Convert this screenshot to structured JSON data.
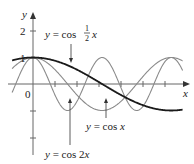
{
  "chart_data": {
    "type": "line",
    "title": "",
    "xlabel": "x",
    "ylabel": "y",
    "origin_label": "0",
    "y_tick_labels": [
      "1",
      "2"
    ],
    "xlim": [
      -0.95,
      6.8
    ],
    "ylim": [
      -2.6,
      2.6
    ],
    "grid": false,
    "legend": "annotations with arrows",
    "series": [
      {
        "name": "y = cos ½x",
        "function": "cos(x/2)",
        "style": "thick dark",
        "color": "#1a1a1a"
      },
      {
        "name": "y = cos x",
        "function": "cos(x)",
        "style": "thin gray",
        "color": "#8a8a8a"
      },
      {
        "name": "y = cos 2x",
        "function": "cos(2x)",
        "style": "thin gray",
        "color": "#8a8a8a"
      }
    ],
    "annotations": [
      {
        "text_prefix": "y = cos",
        "frac_num": "1",
        "frac_den": "2",
        "text_suffix": "x"
      },
      {
        "text": "y = cos x"
      },
      {
        "text": "y = cos 2x"
      }
    ]
  },
  "axes": {
    "x_label": "x",
    "y_label": "y",
    "origin": "0",
    "tick1": "1",
    "tick2": "2"
  },
  "labels": {
    "half_prefix": "y = cos",
    "half_num": "1",
    "half_den": "2",
    "half_suffix": "x",
    "cosx": "y = cos x",
    "cos2x": "y = cos 2x"
  }
}
